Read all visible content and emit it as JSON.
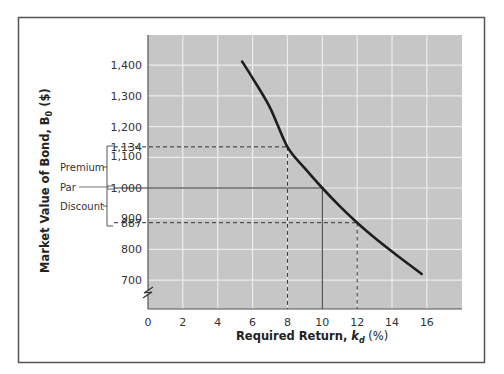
{
  "chart_data": {
    "type": "line",
    "title": "",
    "xlabel": "Required Return, k_d (%)",
    "xlabel_parts": {
      "main": "Required Return, ",
      "var": "k",
      "sub": "d",
      "suffix": " (%)"
    },
    "ylabel": "Market Value of Bond, B0 ($)",
    "ylabel_parts": {
      "main": "Market Value of Bond, ",
      "var": "B",
      "sub": "0",
      "suffix": " ($)"
    },
    "xlim": [
      0,
      18
    ],
    "ylim": [
      620,
      1500
    ],
    "x_ticks": [
      0,
      2,
      4,
      6,
      8,
      10,
      12,
      14,
      16
    ],
    "y_ticks": [
      700,
      800,
      900,
      1000,
      1100,
      1200,
      1300,
      1400
    ],
    "y_tick_labels": [
      "700",
      "800",
      "900",
      "1,000",
      "1,100",
      "1,200",
      "1,300",
      "1,400"
    ],
    "extra_y_labels": [
      {
        "value": 1134,
        "label": "1,134"
      },
      {
        "value": 887,
        "label": "887"
      }
    ],
    "grid": true,
    "axis_break": true,
    "series": [
      {
        "name": "Bond value curve",
        "x": [
          5.4,
          6,
          7,
          8,
          9,
          10,
          11,
          12,
          13,
          14,
          15,
          15.7
        ],
        "y": [
          1412,
          1358,
          1262,
          1134,
          1064,
          1000,
          941,
          887,
          838,
          793,
          750,
          720
        ]
      }
    ],
    "reference_lines": [
      {
        "kind": "dashed",
        "x": 8,
        "y": 1134,
        "label": "Premium"
      },
      {
        "kind": "solid",
        "x": 10,
        "y": 1000,
        "label": "Par"
      },
      {
        "kind": "dashed",
        "x": 12,
        "y": 887,
        "label": "Discount"
      }
    ],
    "annotations": [
      "Premium",
      "Par",
      "Discount"
    ]
  },
  "colors": {
    "plot_bg": "#c6c6c6",
    "grid": "#ececec",
    "curve": "#1e1e1e",
    "frame": "#555555",
    "text": "#333333"
  }
}
